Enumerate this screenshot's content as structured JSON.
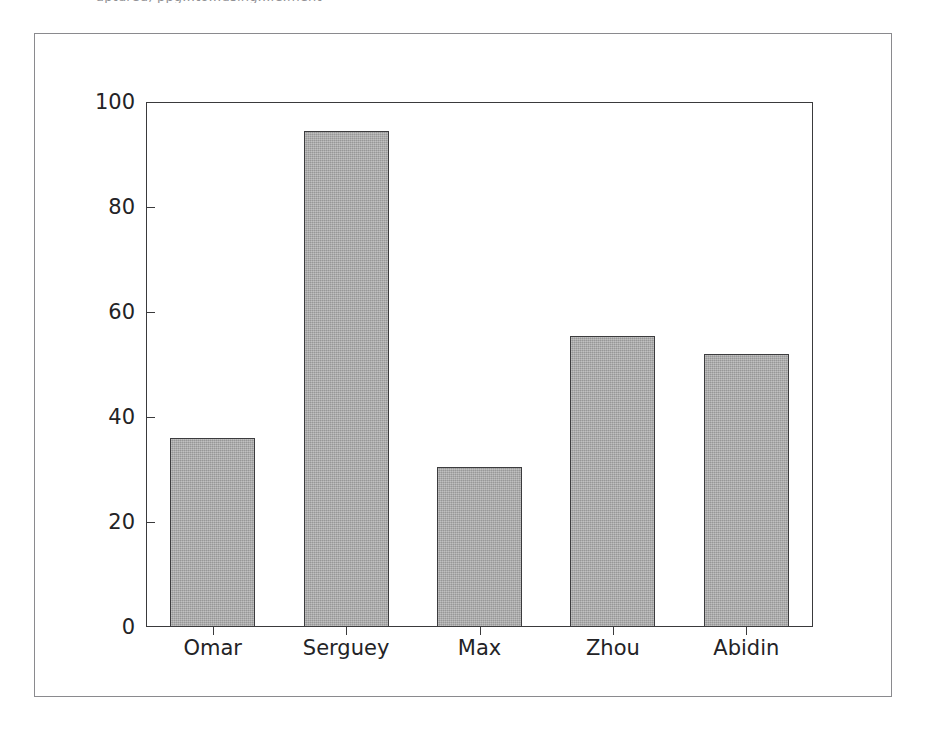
{
  "clipped_header_text": "aptured, ppg...to...using...le.ment",
  "figure": {
    "background_color": "#ffffff",
    "frame_color": "#8a8a8e",
    "axis_color": "#3a3a3c"
  },
  "chart_data": {
    "type": "bar",
    "title": "",
    "xlabel": "",
    "ylabel": "",
    "categories": [
      "Omar",
      "Serguey",
      "Max",
      "Zhou",
      "Abidin"
    ],
    "values": [
      36,
      94.5,
      30.5,
      55.5,
      52
    ],
    "ylim": [
      0,
      100
    ],
    "yticks": [
      0,
      20,
      40,
      60,
      80,
      100
    ],
    "ytick_labels": [
      "0",
      "20",
      "40",
      "60",
      "80",
      "100"
    ],
    "grid": false,
    "legend": null,
    "bar_color": "#a8a8a8",
    "bar_edge_color": "#3c3c3e"
  }
}
